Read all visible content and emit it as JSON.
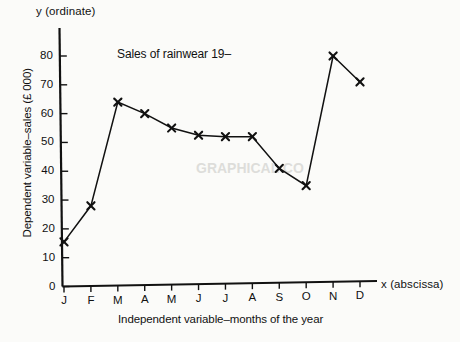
{
  "figure": {
    "background_color": "#fbfbf9",
    "ink_color": "#111111"
  },
  "axis_markers": {
    "y_top": "y  (ordinate)",
    "x_right": "x  (abscissa)"
  },
  "chart_data": {
    "type": "line",
    "title": "Sales of rainwear 19–",
    "xlabel": "Independent variable–months of the year",
    "ylabel": "Dependent variable–sales (£ 000)",
    "categories": [
      "J",
      "F",
      "M",
      "A",
      "M",
      "J",
      "J",
      "A",
      "S",
      "O",
      "N",
      "D"
    ],
    "values": [
      15.5,
      28,
      64,
      60,
      55,
      52.5,
      52,
      52,
      41,
      35,
      80,
      71
    ],
    "ylim": [
      0,
      85
    ],
    "yticks": [
      0,
      10,
      20,
      30,
      40,
      50,
      60,
      70,
      80
    ],
    "ytick_labels": [
      "0",
      "10",
      "20",
      "30",
      "40",
      "50",
      "60",
      "70",
      "80"
    ],
    "grid": false,
    "legend": "none",
    "marker": "x",
    "line_color": "#111111",
    "marker_color": "#111111"
  },
  "ghost_text": [
    {
      "text": "GRAPHICAL CO",
      "x": 196,
      "y": 168,
      "size": 14
    },
    {
      "text": "a",
      "x": 96,
      "y": 96,
      "size": 12
    }
  ]
}
